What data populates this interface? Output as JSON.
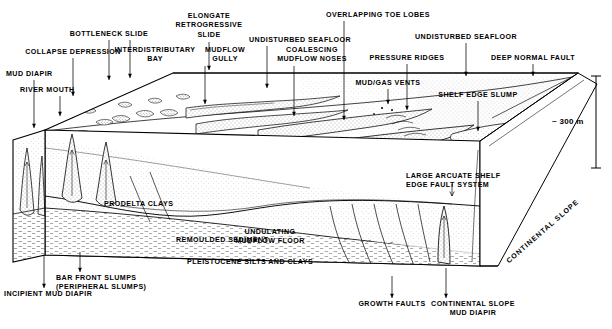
{
  "figure": {
    "scale": {
      "label": "~ 300 m",
      "tilde": "~",
      "value": "300",
      "unit": "m"
    },
    "colors": {
      "ink": "#000000",
      "paper": "#ffffff",
      "stipple": "#4a4a4a",
      "light_fill": "#f2f2f2"
    }
  },
  "labels_top": [
    {
      "id": "collapse-depression",
      "text": "COLLAPSE DEPRESSION",
      "x": 73,
      "y": 48,
      "align": "c",
      "leader": {
        "x1": 73,
        "y1": 58,
        "x2": 73,
        "y2": 96
      }
    },
    {
      "id": "bottleneck-slide",
      "text": "BOTTLENECK SLIDE",
      "x": 109,
      "y": 30,
      "align": "c",
      "leader": {
        "x1": 109,
        "y1": 40,
        "x2": 109,
        "y2": 80
      }
    },
    {
      "id": "interdistributary-bay",
      "text": "INTERDISTRIBUTARY\nBAY",
      "x": 155,
      "y": 46,
      "align": "c",
      "leader": {
        "x1": 130,
        "y1": 40,
        "x2": 130,
        "y2": 78
      }
    },
    {
      "id": "elongate-retrogressive-slide",
      "text": "ELONGATE\nRETROGRESSIVE\nSLIDE",
      "x": 209,
      "y": 12,
      "align": "c",
      "leader": {
        "x1": 209,
        "y1": 42,
        "x2": 209,
        "y2": 70
      }
    },
    {
      "id": "mudflow-gully",
      "text": "MUDFLOW\nGULLY",
      "x": 225,
      "y": 46,
      "align": "c",
      "leader": {
        "x1": 205,
        "y1": 66,
        "x2": 205,
        "y2": 104
      }
    },
    {
      "id": "undisturbed-seafloor-left",
      "text": "UNDISTURBED SEAFLOOR",
      "x": 300,
      "y": 36,
      "align": "c",
      "leader": {
        "x1": 267,
        "y1": 46,
        "x2": 267,
        "y2": 88
      }
    },
    {
      "id": "coalescing-mudflow-noses",
      "text": "COALESCING\nMUDFLOW NOSES",
      "x": 312,
      "y": 46,
      "align": "c",
      "leader": {
        "x1": 294,
        "y1": 66,
        "x2": 294,
        "y2": 116
      }
    },
    {
      "id": "overlapping-toe-lobes",
      "text": "OVERLAPPING TOE LOBES",
      "x": 378,
      "y": 11,
      "align": "c",
      "leader": {
        "x1": 344,
        "y1": 21,
        "x2": 344,
        "y2": 120
      }
    },
    {
      "id": "pressure-ridges",
      "text": "PRESSURE RIDGES",
      "x": 407,
      "y": 54,
      "align": "c",
      "leader": {
        "x1": 407,
        "y1": 64,
        "x2": 407,
        "y2": 110
      }
    },
    {
      "id": "undisturbed-seafloor-right",
      "text": "UNDISTURBED SEAFLOOR",
      "x": 466,
      "y": 33,
      "align": "c",
      "leader": {
        "x1": 466,
        "y1": 43,
        "x2": 466,
        "y2": 76
      }
    },
    {
      "id": "deep-normal-fault",
      "text": "DEEP NORMAL FAULT",
      "x": 533,
      "y": 54,
      "align": "c",
      "leader": {
        "x1": 533,
        "y1": 64,
        "x2": 533,
        "y2": 76
      }
    },
    {
      "id": "mud-diapir",
      "text": "MUD DIAPIR",
      "x": 6,
      "y": 70,
      "align": "l",
      "leader": {
        "x1": 34,
        "y1": 80,
        "x2": 34,
        "y2": 128
      }
    },
    {
      "id": "river-mouth",
      "text": "RIVER MOUTH",
      "x": 20,
      "y": 86,
      "align": "l",
      "leader": {
        "x1": 60,
        "y1": 96,
        "x2": 60,
        "y2": 116
      }
    },
    {
      "id": "mud-gas-vents",
      "text": "MUD/GAS VENTS",
      "x": 388,
      "y": 79,
      "align": "c",
      "leader": {
        "x1": 388,
        "y1": 89,
        "x2": 388,
        "y2": 104
      }
    },
    {
      "id": "shelf-edge-slump",
      "text": "SHELF EDGE SLUMP",
      "x": 478,
      "y": 91,
      "align": "c",
      "leader": {
        "x1": 478,
        "y1": 101,
        "x2": 478,
        "y2": 131
      }
    }
  ],
  "labels_interior": [
    {
      "id": "prodelta-clays",
      "text": "PRODELTA CLAYS",
      "x": 104,
      "y": 200,
      "align": "l"
    },
    {
      "id": "remoulded-sediment",
      "text": "REMOULDED SEDIMENT",
      "x": 176,
      "y": 236,
      "align": "l"
    },
    {
      "id": "undulating-mudflow-floor",
      "text": "UNDULATING\nMUDFLOW FLOOR",
      "x": 270,
      "y": 228,
      "align": "c"
    },
    {
      "id": "pleistocene-silts-and-clays",
      "text": "PLEISTOCENE SILTS AND CLAYS",
      "x": 187,
      "y": 258,
      "align": "l"
    },
    {
      "id": "large-arcuate-shelf-edge-fault-system",
      "text": "LARGE ARCUATE SHELF\nEDGE FAULT SYSTEM",
      "x": 406,
      "y": 172,
      "align": "l"
    }
  ],
  "labels_bottom": [
    {
      "id": "incipient-mud-diapir",
      "text": "INCIPIENT MUD DIAPIR",
      "x": 4,
      "y": 290,
      "align": "l",
      "leader": {
        "x1": 44,
        "y1": 255,
        "x2": 44,
        "y2": 288
      }
    },
    {
      "id": "bar-front-slumps",
      "text": "BAR FRONT SLUMPS\n(PERIPHERAL SLUMPS)",
      "x": 56,
      "y": 274,
      "align": "l",
      "leader": {
        "x1": 80,
        "y1": 252,
        "x2": 80,
        "y2": 272
      }
    },
    {
      "id": "growth-faults",
      "text": "GROWTH FAULTS",
      "x": 392,
      "y": 300,
      "align": "c",
      "leader": {
        "x1": 392,
        "y1": 276,
        "x2": 392,
        "y2": 298
      }
    },
    {
      "id": "continental-slope-mud-diapir",
      "text": "CONTINENTAL SLOPE\nMUD DIAPIR",
      "x": 473,
      "y": 300,
      "align": "c",
      "leader": {
        "x1": 446,
        "y1": 268,
        "x2": 446,
        "y2": 298
      }
    }
  ],
  "labels_rotated": [
    {
      "id": "continental-slope",
      "text": "CONTINENTAL SLOPE",
      "x": 505,
      "y": 259,
      "rotate": -41
    }
  ]
}
